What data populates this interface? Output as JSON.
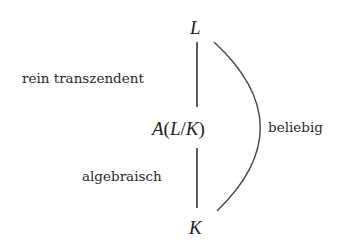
{
  "diagram": {
    "type": "field-extension-tower",
    "nodes": {
      "top": {
        "label": "L"
      },
      "middle": {
        "label": "A(L/K)",
        "parts": {
          "func": "A",
          "open": "(",
          "top": "L",
          "slash": "/",
          "bottom": "K",
          "close": ")"
        }
      },
      "bottom": {
        "label": "K"
      }
    },
    "edges": [
      {
        "from": "middle",
        "to": "top",
        "label": "rein transzendent",
        "style": "straight"
      },
      {
        "from": "bottom",
        "to": "middle",
        "label": "algebraisch",
        "style": "straight"
      },
      {
        "from": "bottom",
        "to": "top",
        "label": "beliebig",
        "style": "arc"
      }
    ],
    "colors": {
      "background": "#ffffff",
      "stroke": "#333333",
      "text": "#2a2a2a"
    }
  }
}
